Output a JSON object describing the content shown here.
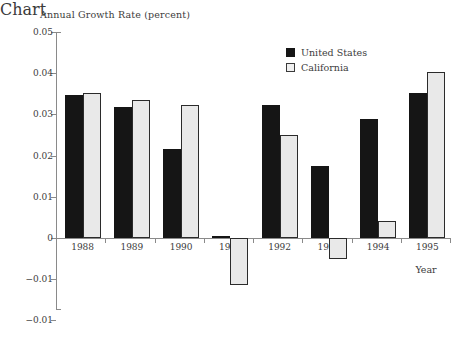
{
  "chart_data": {
    "type": "bar",
    "title": "Annual Growth Rate (percent)",
    "xlabel": "Year",
    "ylabel": "",
    "categories": [
      "1988",
      "1989",
      "1990",
      "1991",
      "1992",
      "1993",
      "1994",
      "1995"
    ],
    "series": [
      {
        "name": "United States",
        "color": "#151515",
        "values": [
          0.0348,
          0.0319,
          0.0216,
          0.0005,
          0.0324,
          0.0174,
          0.0288,
          0.0351
        ]
      },
      {
        "name": "California",
        "color": "#e9e9e9",
        "values": [
          0.0352,
          0.0334,
          0.0324,
          -0.0115,
          0.0249,
          -0.005,
          0.0042,
          0.0402
        ]
      }
    ],
    "ylim": [
      -0.02,
      0.05
    ],
    "ytick_values": [
      0.05,
      0.04,
      0.03,
      0.02,
      0.01,
      0,
      -0.01,
      -0.02
    ],
    "ytick_labels": [
      "0.05",
      "0.04",
      "0.03",
      "0.02",
      "0.01",
      "0",
      "−0.01",
      "−0.01"
    ],
    "grid": false,
    "legend_position": "top-right"
  },
  "legend": {
    "entries": [
      {
        "label": "United States",
        "swatch": "filled-black-square-icon"
      },
      {
        "label": "California",
        "swatch": "outlined-light-square-icon"
      }
    ]
  }
}
